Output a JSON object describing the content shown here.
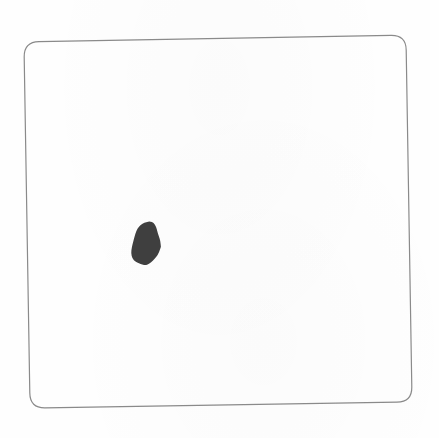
{
  "figure": {
    "frame": {
      "shape": "rounded-square",
      "stroke_color": "#8a8a8a",
      "stroke_width": 1.2,
      "corner_radius": 15,
      "corners": {
        "top_left": [
          24,
          42
        ],
        "top_right": [
          406,
          35
        ],
        "bottom_right": [
          412,
          402
        ],
        "bottom_left": [
          30,
          408
        ]
      }
    },
    "blob": {
      "shape": "irregular-oval",
      "fill_color": "#3f3f3f",
      "center": [
        146,
        244
      ],
      "rx": 14,
      "ry": 22
    },
    "background_color": "#fefefe"
  }
}
